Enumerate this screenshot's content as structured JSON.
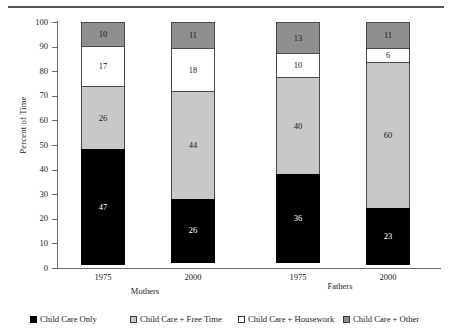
{
  "chart_data": {
    "type": "bar",
    "subtype": "stacked-column-100",
    "title": "",
    "xlabel": "",
    "ylabel": "Percent of Time",
    "ylim": [
      0,
      100
    ],
    "ytick_step": 10,
    "yticks": [
      "100",
      "90",
      "80",
      "70",
      "60",
      "50",
      "40",
      "30",
      "20",
      "10",
      "0"
    ],
    "grid": false,
    "legend_position": "bottom",
    "categories": [
      "1975",
      "2000",
      "1975",
      "2000"
    ],
    "groups": [
      {
        "label": "Mothers",
        "categories": [
          "1975",
          "2000"
        ]
      },
      {
        "label": "Fathers",
        "categories": [
          "1975",
          "2000"
        ]
      }
    ],
    "series": [
      {
        "name": "Child Care Only",
        "color": "#000000",
        "values": [
          47,
          26,
          36,
          23
        ]
      },
      {
        "name": "Child Care + Free Time",
        "color": "#c8c8c8",
        "values": [
          26,
          44,
          40,
          60
        ]
      },
      {
        "name": "Child Care + Housework",
        "color": "#ffffff",
        "values": [
          17,
          18,
          10,
          6
        ]
      },
      {
        "name": "Child Care + Other",
        "color": "#8f8f8f",
        "values": [
          10,
          11,
          13,
          11
        ]
      }
    ],
    "bars": [
      {
        "category": "1975",
        "group": "Mothers",
        "segments": [
          {
            "series": "Child Care + Other",
            "value": 10,
            "label": "10"
          },
          {
            "series": "Child Care + Housework",
            "value": 17,
            "label": "17"
          },
          {
            "series": "Child Care + Free Time",
            "value": 26,
            "label": "26"
          },
          {
            "series": "Child Care Only",
            "value": 47,
            "label": "47"
          }
        ]
      },
      {
        "category": "2000",
        "group": "Mothers",
        "segments": [
          {
            "series": "Child Care + Other",
            "value": 11,
            "label": "11"
          },
          {
            "series": "Child Care + Housework",
            "value": 18,
            "label": "18"
          },
          {
            "series": "Child Care + Free Time",
            "value": 44,
            "label": "44"
          },
          {
            "series": "Child Care Only",
            "value": 26,
            "label": "26"
          }
        ]
      },
      {
        "category": "1975",
        "group": "Fathers",
        "segments": [
          {
            "series": "Child Care + Other",
            "value": 13,
            "label": "13"
          },
          {
            "series": "Child Care + Housework",
            "value": 10,
            "label": "10"
          },
          {
            "series": "Child Care + Free Time",
            "value": 40,
            "label": "40"
          },
          {
            "series": "Child Care Only",
            "value": 36,
            "label": "36"
          }
        ]
      },
      {
        "category": "2000",
        "group": "Fathers",
        "segments": [
          {
            "series": "Child Care + Other",
            "value": 11,
            "label": "11"
          },
          {
            "series": "Child Care + Housework",
            "value": 6,
            "label": "6"
          },
          {
            "series": "Child Care + Free Time",
            "value": 60,
            "label": "60"
          },
          {
            "series": "Child Care Only",
            "value": 23,
            "label": "23"
          }
        ]
      }
    ]
  },
  "axis": {
    "y_title": "Percent of Time",
    "ticks": [
      "100",
      "90",
      "80",
      "70",
      "60",
      "50",
      "40",
      "30",
      "20",
      "10",
      "0"
    ]
  },
  "xaxis": {
    "tick_labels": [
      "1975",
      "2000",
      "1975",
      "2000"
    ],
    "group_labels": [
      "Mothers",
      "Fathers"
    ]
  },
  "legend": {
    "items": [
      {
        "label": "Child Care Only",
        "color": "#000000"
      },
      {
        "label": "Child Care + Free Time",
        "color": "#c8c8c8"
      },
      {
        "label": "Child Care + Housework",
        "color": "#ffffff"
      },
      {
        "label": "Child Care + Other",
        "color": "#8f8f8f"
      }
    ]
  }
}
